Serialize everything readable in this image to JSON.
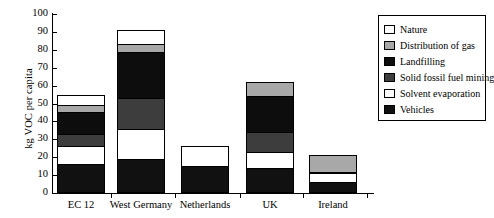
{
  "chart_data": {
    "type": "bar",
    "subtype": "stacked",
    "title": "",
    "xlabel": "",
    "ylabel": "kg VOC per capita",
    "ylim": [
      0,
      100
    ],
    "ytick_step": 10,
    "yticks": [
      0,
      10,
      20,
      30,
      40,
      50,
      60,
      70,
      80,
      90,
      100
    ],
    "ytick_labels": [
      "0",
      "10",
      "20",
      "30",
      "40",
      "50",
      "60",
      "70",
      "80",
      "90",
      "100"
    ],
    "grid": false,
    "legend_position": "right",
    "categories": [
      "EC 12",
      "West Germany",
      "Netherlands",
      "UK",
      "Ireland"
    ],
    "series": [
      {
        "name": "Vehicles",
        "color": "#111111",
        "values": [
          16,
          19,
          15,
          14,
          6
        ]
      },
      {
        "name": "Solvent evaporation",
        "color": "#ffffff",
        "values": [
          10,
          17,
          11,
          9,
          5
        ]
      },
      {
        "name": "Solid fossil fuel mining",
        "color": "#3d3d3d",
        "values": [
          7,
          17,
          0,
          11,
          1
        ]
      },
      {
        "name": "Landfilling",
        "color": "#0d0d0d",
        "values": [
          12,
          26,
          0,
          20,
          0
        ]
      },
      {
        "name": "Distribution of gas",
        "color": "#a8a8a8",
        "values": [
          4,
          4,
          0,
          8,
          9
        ]
      },
      {
        "name": "Nature",
        "color": "#ffffff",
        "values": [
          6,
          8,
          0,
          0,
          0
        ]
      }
    ],
    "totals": [
      55,
      91,
      26,
      62,
      21
    ],
    "legend_entries": [
      {
        "label": "Nature",
        "color": "#ffffff"
      },
      {
        "label": "Distribution of gas",
        "color": "#a8a8a8"
      },
      {
        "label": "Landfilling",
        "color": "#0d0d0d"
      },
      {
        "label": "Solid fossil fuel mining",
        "color": "#3d3d3d"
      },
      {
        "label": "Solvent evaporation",
        "color": "#ffffff"
      },
      {
        "label": "Vehicles",
        "color": "#111111"
      }
    ]
  }
}
